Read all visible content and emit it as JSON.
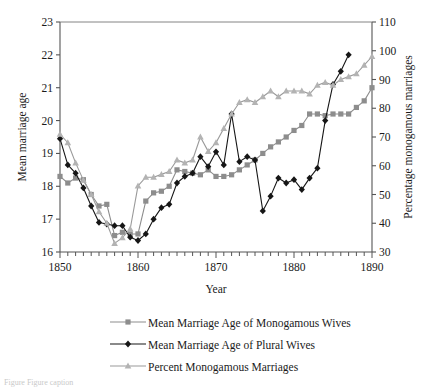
{
  "chart_data": {
    "type": "line",
    "title": "",
    "subtitle": "",
    "xlabel": "Year",
    "ylabel": "Mean marriage age",
    "y2label": "Percentage monogamous marriages",
    "xlim": [
      1850,
      1890
    ],
    "ylim": [
      16,
      23
    ],
    "y2lim": [
      30,
      110
    ],
    "xticks": [
      1850,
      1860,
      1870,
      1880,
      1890
    ],
    "xtick_labels": [
      "1850",
      "1860",
      "1870",
      "1880",
      "1890"
    ],
    "x_minor_tick_step": 1,
    "yticks": [
      16,
      17,
      18,
      19,
      20,
      21,
      22,
      23
    ],
    "ytick_labels": [
      "16",
      "17",
      "18",
      "19",
      "20",
      "21",
      "22",
      "23"
    ],
    "y2ticks": [
      30,
      40,
      50,
      60,
      70,
      80,
      90,
      100,
      110
    ],
    "y2tick_labels": [
      "30",
      "40",
      "50",
      "60",
      "70",
      "80",
      "90",
      "100",
      "110"
    ],
    "grid": false,
    "legend_position": "bottom",
    "series": [
      {
        "name": "Mean Marriage Age of Monogamous Wives",
        "axis": "left",
        "marker": "square",
        "color": "#8d8d8d",
        "line_color": "#8d8d8d",
        "x": [
          1850,
          1851,
          1852,
          1853,
          1854,
          1855,
          1856,
          1857,
          1858,
          1859,
          1860,
          1861,
          1862,
          1863,
          1864,
          1865,
          1866,
          1867,
          1868,
          1869,
          1870,
          1871,
          1872,
          1873,
          1874,
          1875,
          1876,
          1877,
          1878,
          1879,
          1880,
          1881,
          1882,
          1883,
          1884,
          1885,
          1886,
          1887,
          1888,
          1889,
          1890
        ],
        "y": [
          18.3,
          18.1,
          18.25,
          18.2,
          17.75,
          17.4,
          17.45,
          16.5,
          16.6,
          16.55,
          16.55,
          17.55,
          17.8,
          17.85,
          18.0,
          18.5,
          18.45,
          18.4,
          18.35,
          18.5,
          18.3,
          18.3,
          18.35,
          18.5,
          18.65,
          18.8,
          19.0,
          19.2,
          19.35,
          19.5,
          19.7,
          19.85,
          20.2,
          20.2,
          20.15,
          20.2,
          20.2,
          20.2,
          20.4,
          20.6,
          21.0
        ]
      },
      {
        "name": "Mean  Marriage Age of Plural Wives",
        "axis": "left",
        "marker": "diamond",
        "color": "#161616",
        "line_color": "#161616",
        "x": [
          1850,
          1851,
          1852,
          1853,
          1854,
          1855,
          1856,
          1857,
          1858,
          1859,
          1860,
          1861,
          1862,
          1863,
          1864,
          1865,
          1866,
          1867,
          1868,
          1869,
          1870,
          1871,
          1872,
          1873,
          1874,
          1875,
          1876,
          1877,
          1878,
          1879,
          1880,
          1881,
          1882,
          1883,
          1884,
          1885,
          1886,
          1887
        ],
        "y": [
          19.45,
          18.65,
          18.4,
          17.95,
          17.4,
          16.9,
          16.85,
          16.8,
          16.8,
          16.45,
          16.35,
          16.55,
          17.0,
          17.35,
          17.45,
          18.1,
          18.3,
          18.4,
          18.9,
          18.6,
          19.05,
          18.65,
          20.2,
          18.75,
          18.9,
          18.8,
          17.25,
          17.7,
          18.25,
          18.1,
          18.2,
          17.9,
          18.25,
          18.55,
          20.0,
          21.1,
          21.5,
          22.0
        ]
      },
      {
        "name": "Percent Monogamous Marriages",
        "axis": "right",
        "marker": "triangle",
        "color": "#b3b3b3",
        "line_color": "#9a9a9a",
        "x": [
          1850,
          1851,
          1852,
          1853,
          1854,
          1855,
          1856,
          1857,
          1858,
          1859,
          1860,
          1861,
          1862,
          1863,
          1864,
          1865,
          1866,
          1867,
          1868,
          1869,
          1870,
          1871,
          1872,
          1873,
          1874,
          1875,
          1876,
          1877,
          1878,
          1879,
          1880,
          1881,
          1882,
          1883,
          1884,
          1885,
          1886,
          1887,
          1888,
          1889,
          1890
        ],
        "y": [
          71,
          68,
          61,
          55,
          50,
          44,
          40,
          33,
          35,
          38,
          53,
          56,
          56,
          57,
          58,
          62,
          61,
          62,
          70,
          65,
          68,
          73,
          78,
          82,
          83,
          82,
          84,
          86,
          84,
          86,
          86,
          86,
          85,
          88,
          89,
          88,
          90,
          91,
          92,
          95,
          98
        ]
      }
    ]
  },
  "legend": {
    "items": [
      {
        "label": "Mean Marriage Age of Monogamous Wives",
        "marker": "square",
        "color": "#8d8d8d"
      },
      {
        "label": "Mean  Marriage Age of Plural Wives",
        "marker": "diamond",
        "color": "#161616"
      },
      {
        "label": "Percent Monogamous Marriages",
        "marker": "triangle",
        "color": "#b3b3b3"
      }
    ]
  },
  "caption": {
    "text": "Figure    Figure caption"
  }
}
